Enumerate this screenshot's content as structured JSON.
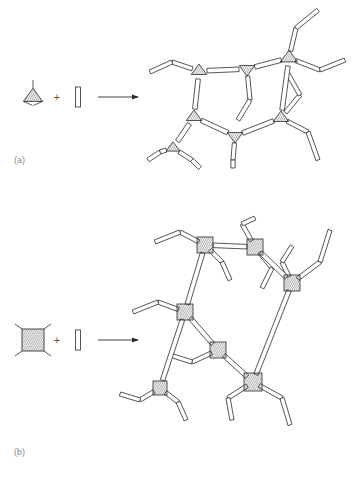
{
  "figure": {
    "background_color": "#ffffff",
    "line_color": "#2b2b2b",
    "hatch_color": "#4a4a4a",
    "label_color": "#8a8a8a",
    "type": "reaction-schematic"
  },
  "panels": [
    {
      "id": "a",
      "label": "(a)",
      "node_shape": "triangle",
      "node_connectivity": 3,
      "linker_shape": "rod",
      "operator": "+",
      "arrow": "right-arrow",
      "network": "hexagonal-ring framework of trigonal nodes joined by rod linkers"
    },
    {
      "id": "b",
      "label": "(b)",
      "node_shape": "square",
      "node_connectivity": 4,
      "linker_shape": "rod",
      "operator": "+",
      "arrow": "right-arrow",
      "network": "branched framework of square nodes joined by rod linkers"
    }
  ],
  "reactants": {
    "a": {
      "node_label": "trigonal-node",
      "linker_label": "rod-linker"
    },
    "b": {
      "node_label": "square-node",
      "linker_label": "rod-linker"
    }
  },
  "chart_data": {
    "type": "diagram",
    "title": "",
    "panel_a": {
      "label": "(a)",
      "node_type": "triangle",
      "node_degree": 3,
      "reagent_nodes": [
        {
          "x": 33,
          "y": 97,
          "r": 11,
          "rot": 0
        }
      ],
      "reagent_linker": {
        "x": 78,
        "y": 97,
        "len": 20,
        "ang": 90
      },
      "plus_pos": {
        "x": 57,
        "y": 97
      },
      "arrow": {
        "x1": 98,
        "y1": 97,
        "x2": 138,
        "y2": 97
      },
      "network_nodes": [
        {
          "x": 199,
          "y": 71,
          "r": 9,
          "rot": 0
        },
        {
          "x": 247,
          "y": 69,
          "r": 9,
          "rot": 180
        },
        {
          "x": 289,
          "y": 58,
          "r": 10,
          "rot": 0
        },
        {
          "x": 194,
          "y": 117,
          "r": 9,
          "rot": 0
        },
        {
          "x": 235,
          "y": 136,
          "r": 9,
          "rot": 180
        },
        {
          "x": 281,
          "y": 118,
          "r": 9,
          "rot": 0
        },
        {
          "x": 173,
          "y": 148,
          "r": 8,
          "rot": 0
        }
      ],
      "network_bonds": [
        [
          199,
          71,
          247,
          69
        ],
        [
          247,
          69,
          289,
          58
        ],
        [
          199,
          71,
          194,
          117
        ],
        [
          194,
          117,
          235,
          136
        ],
        [
          235,
          136,
          281,
          118
        ],
        [
          281,
          118,
          289,
          58
        ],
        [
          194,
          117,
          173,
          148
        ]
      ],
      "pendants": [
        [
          199,
          71,
          172,
          62,
          150,
          72
        ],
        [
          289,
          58,
          296,
          28,
          318,
          10
        ],
        [
          289,
          58,
          320,
          70,
          345,
          60
        ],
        [
          247,
          69,
          250,
          100,
          238,
          120
        ],
        [
          281,
          118,
          300,
          95,
          288,
          74
        ],
        [
          281,
          118,
          308,
          132,
          318,
          160
        ],
        [
          235,
          136,
          233,
          160,
          233,
          168
        ],
        [
          173,
          148,
          160,
          152,
          148,
          160
        ],
        [
          173,
          148,
          192,
          160,
          200,
          168
        ]
      ]
    },
    "panel_b": {
      "label": "(b)",
      "node_type": "square",
      "node_degree": 4,
      "reagent_nodes": [
        {
          "x": 33,
          "y": 340,
          "s": 11,
          "rot": 0
        }
      ],
      "reagent_linker": {
        "x": 78,
        "y": 340,
        "len": 20,
        "ang": 90
      },
      "plus_pos": {
        "x": 57,
        "y": 340
      },
      "arrow": {
        "x1": 98,
        "y1": 340,
        "x2": 138,
        "y2": 340
      },
      "network_nodes": [
        {
          "x": 205,
          "y": 245,
          "s": 8,
          "rot": 0
        },
        {
          "x": 255,
          "y": 247,
          "s": 8,
          "rot": 0
        },
        {
          "x": 292,
          "y": 283,
          "s": 8,
          "rot": 0
        },
        {
          "x": 185,
          "y": 312,
          "s": 8,
          "rot": 0
        },
        {
          "x": 218,
          "y": 350,
          "s": 8,
          "rot": 0
        },
        {
          "x": 160,
          "y": 388,
          "s": 7,
          "rot": 0
        },
        {
          "x": 253,
          "y": 382,
          "s": 9,
          "rot": 0
        }
      ],
      "network_bonds": [
        [
          205,
          245,
          255,
          247
        ],
        [
          255,
          247,
          292,
          283
        ],
        [
          205,
          245,
          185,
          312
        ],
        [
          185,
          312,
          218,
          350
        ],
        [
          218,
          350,
          253,
          382
        ],
        [
          292,
          283,
          253,
          382
        ],
        [
          185,
          312,
          160,
          388
        ]
      ],
      "pendants": [
        [
          205,
          245,
          180,
          232,
          155,
          242
        ],
        [
          205,
          245,
          222,
          262,
          230,
          280
        ],
        [
          255,
          247,
          242,
          224,
          255,
          218
        ],
        [
          255,
          247,
          272,
          268,
          262,
          288
        ],
        [
          292,
          283,
          282,
          262,
          292,
          246
        ],
        [
          292,
          283,
          320,
          262,
          330,
          230
        ],
        [
          185,
          312,
          158,
          302,
          133,
          312
        ],
        [
          218,
          350,
          192,
          362,
          170,
          355
        ],
        [
          253,
          382,
          228,
          398,
          232,
          420
        ],
        [
          253,
          382,
          282,
          398,
          290,
          425
        ],
        [
          160,
          388,
          140,
          400,
          120,
          394
        ],
        [
          160,
          388,
          178,
          402,
          186,
          420
        ]
      ]
    }
  }
}
